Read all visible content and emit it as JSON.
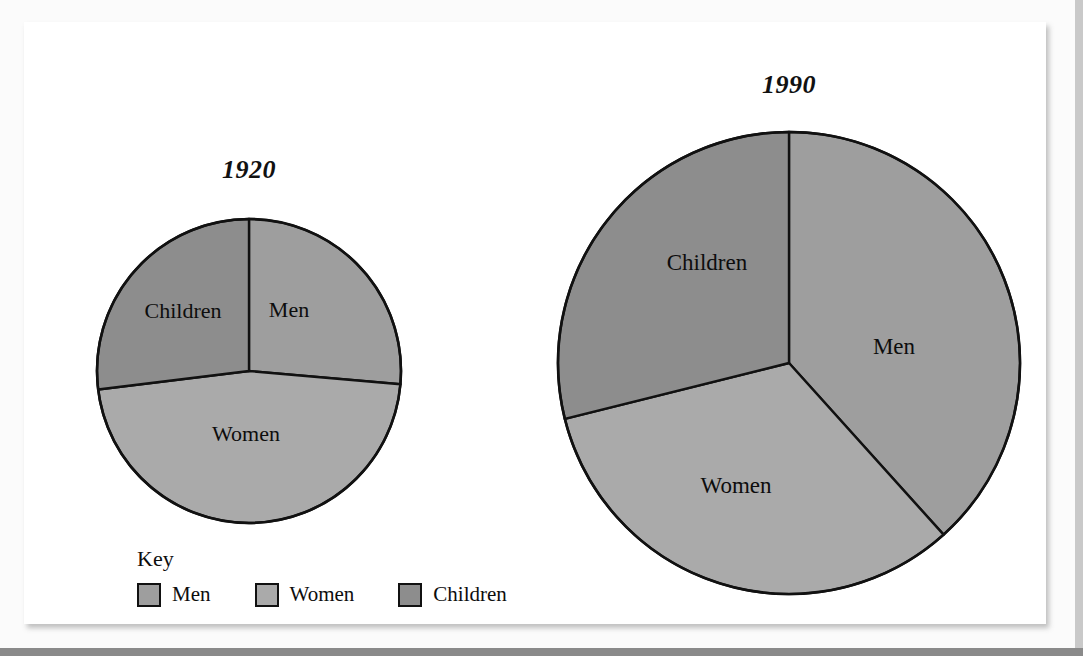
{
  "page": {
    "background": "#fbfbfb",
    "paper": "#ffffff"
  },
  "colors": {
    "men": "#9e9e9e",
    "women": "#aaaaaa",
    "children": "#8d8d8d",
    "outline": "#111111",
    "text": "#0d0d0d"
  },
  "legend": {
    "title": "Key",
    "items": [
      {
        "label": "Men",
        "color": "#9e9e9e"
      },
      {
        "label": "Women",
        "color": "#aaaaaa"
      },
      {
        "label": "Children",
        "color": "#8d8d8d"
      }
    ]
  },
  "chart_data": [
    {
      "type": "pie",
      "title": "1920",
      "categories": [
        "Men",
        "Women",
        "Children"
      ],
      "values": [
        26,
        47,
        27
      ],
      "unit": "percent",
      "start_angle_deg": 0,
      "direction": "clockwise",
      "radius_px": 151,
      "slice_angles_deg": [
        95,
        168,
        97
      ],
      "labels_inside": true,
      "legend_position": "bottom-left",
      "grid": false,
      "xlabel": "",
      "ylabel": ""
    },
    {
      "type": "pie",
      "title": "1990",
      "categories": [
        "Men",
        "Women",
        "Children"
      ],
      "values": [
        38,
        33,
        29
      ],
      "unit": "percent",
      "start_angle_deg": 0,
      "direction": "clockwise",
      "radius_px": 230,
      "slice_angles_deg": [
        138,
        118,
        104
      ],
      "labels_inside": true,
      "legend_position": "bottom-left",
      "grid": false,
      "xlabel": "",
      "ylabel": ""
    }
  ]
}
